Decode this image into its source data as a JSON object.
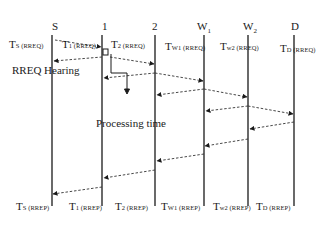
{
  "diagram": {
    "title": "",
    "nodes": [
      {
        "id": "S",
        "label": "S",
        "sub": "",
        "x": 52
      },
      {
        "id": "1",
        "label": "1",
        "sub": "",
        "x": 102
      },
      {
        "id": "2",
        "label": "2",
        "sub": "",
        "x": 155
      },
      {
        "id": "W1",
        "label": "W",
        "sub": "1",
        "x": 204
      },
      {
        "id": "W2",
        "label": "W",
        "sub": "2",
        "x": 248
      },
      {
        "id": "D",
        "label": "D",
        "sub": "",
        "x": 294
      }
    ],
    "rreq_labels": [
      {
        "main": "T",
        "sub": "S (RREQ)"
      },
      {
        "main": "T",
        "sub": "1 (RREQ)"
      },
      {
        "main": "T",
        "sub": "2 (RREQ)"
      },
      {
        "main": "T",
        "sub": "W1 (RREQ)"
      },
      {
        "main": "T",
        "sub": "w2 (RREQ)"
      },
      {
        "main": "T",
        "sub": "D (RREQ)"
      }
    ],
    "rrep_labels": [
      {
        "main": "T",
        "sub": "S (RREP)"
      },
      {
        "main": "T",
        "sub": "1 (RREP)"
      },
      {
        "main": "T",
        "sub": "2 (RREP)"
      },
      {
        "main": "T",
        "sub": "W1 (RREP)"
      },
      {
        "main": "T",
        "sub": "w2 (RREP)"
      },
      {
        "main": "T",
        "sub": "D (RREP)"
      }
    ],
    "annotations": {
      "rreq_hearing": "RREQ Hearing",
      "processing_time": "Processing time",
      "delay_marker": "D"
    },
    "messages": [
      {
        "from": "S",
        "to": "1",
        "x1": 55,
        "y1": 40,
        "x2": 101,
        "y2": 47
      },
      {
        "from": "1",
        "to": "S",
        "x1": 102,
        "y1": 57,
        "x2": 54,
        "y2": 61
      },
      {
        "from": "1",
        "to": "2",
        "x1": 110,
        "y1": 57,
        "x2": 154,
        "y2": 64
      },
      {
        "from": "2",
        "to": "1",
        "x1": 155,
        "y1": 73,
        "x2": 104,
        "y2": 78
      },
      {
        "from": "2",
        "to": "W1",
        "x1": 155,
        "y1": 73,
        "x2": 203,
        "y2": 81
      },
      {
        "from": "W1",
        "to": "2",
        "x1": 204,
        "y1": 89,
        "x2": 157,
        "y2": 95
      },
      {
        "from": "W1",
        "to": "W2",
        "x1": 204,
        "y1": 89,
        "x2": 247,
        "y2": 97
      },
      {
        "from": "W2",
        "to": "W1",
        "x1": 248,
        "y1": 106,
        "x2": 206,
        "y2": 111
      },
      {
        "from": "W2",
        "to": "D",
        "x1": 248,
        "y1": 106,
        "x2": 293,
        "y2": 114
      },
      {
        "from": "D",
        "to": "W2",
        "x1": 294,
        "y1": 122,
        "x2": 250,
        "y2": 129
      },
      {
        "from": "W2",
        "to": "W1",
        "x1": 248,
        "y1": 139,
        "x2": 205,
        "y2": 146
      },
      {
        "from": "W1",
        "to": "2",
        "x1": 204,
        "y1": 154,
        "x2": 157,
        "y2": 161
      },
      {
        "from": "2",
        "to": "1",
        "x1": 155,
        "y1": 170,
        "x2": 104,
        "y2": 178
      },
      {
        "from": "1",
        "to": "S",
        "x1": 102,
        "y1": 187,
        "x2": 53,
        "y2": 194
      }
    ],
    "colors": {
      "line": "#1a1a1a",
      "dashed": "#333333",
      "background": "#ffffff"
    }
  }
}
